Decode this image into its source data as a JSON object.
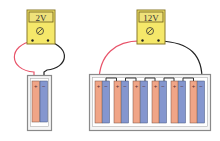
{
  "diagram": {
    "left": {
      "meter_reading": "2V",
      "cells": 1
    },
    "right": {
      "meter_reading": "12V",
      "cells": 6
    },
    "colors": {
      "meter_body": "#f5e86a",
      "meter_border": "#8a7a2a",
      "display_bg": "#efe27a",
      "positive_plate": "#f0a587",
      "negative_plate": "#8496cf",
      "holder_border": "#8a8a8a",
      "wire_red": "#e8546a",
      "wire_black": "#222222"
    },
    "labels": {
      "plus": "+",
      "minus": "−"
    }
  }
}
